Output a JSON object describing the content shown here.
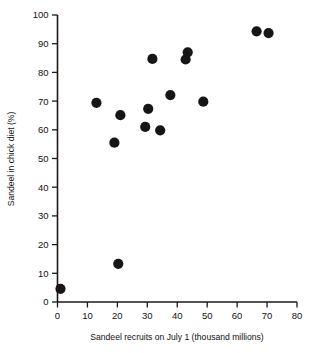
{
  "chart_data": {
    "type": "scatter",
    "title": "",
    "xlabel": "Sandeel recruits on July 1 (thousand millions)",
    "ylabel": "Sandeel in chick diet (%)",
    "xlim": [
      0,
      80
    ],
    "ylim": [
      0,
      100
    ],
    "xticks": [
      0,
      10,
      20,
      30,
      40,
      50,
      60,
      70,
      80
    ],
    "yticks": [
      0,
      10,
      20,
      30,
      40,
      50,
      60,
      70,
      80,
      90,
      100
    ],
    "xtick_labels": [
      "0",
      "10",
      "20",
      "30",
      "40",
      "50",
      "60",
      "70",
      "80"
    ],
    "ytick_labels": [
      "0",
      "10",
      "20",
      "30",
      "40",
      "50",
      "60",
      "70",
      "80",
      "90",
      "100"
    ],
    "grid": false,
    "legend": false,
    "legend_position": "none",
    "marker": "filled-circle",
    "marker_color": "#161616",
    "marker_size": 6.4,
    "n_points": 15,
    "x": [
      1.0,
      13.0,
      19.0,
      20.3,
      21.0,
      29.3,
      30.3,
      31.7,
      34.3,
      37.7,
      42.8,
      43.5,
      48.7,
      66.5,
      70.5
    ],
    "y": [
      4.6,
      69.4,
      55.5,
      13.3,
      65.1,
      61.0,
      67.3,
      84.7,
      59.8,
      72.1,
      84.5,
      87.0,
      69.8,
      94.3,
      93.7
    ],
    "points": [
      {
        "x": 1.0,
        "y": 4.6
      },
      {
        "x": 13.0,
        "y": 69.4
      },
      {
        "x": 19.0,
        "y": 55.5
      },
      {
        "x": 20.3,
        "y": 13.3
      },
      {
        "x": 21.0,
        "y": 65.1
      },
      {
        "x": 29.3,
        "y": 61.0
      },
      {
        "x": 30.3,
        "y": 67.3
      },
      {
        "x": 31.7,
        "y": 84.7
      },
      {
        "x": 34.3,
        "y": 59.8
      },
      {
        "x": 37.7,
        "y": 72.1
      },
      {
        "x": 42.8,
        "y": 84.5
      },
      {
        "x": 43.5,
        "y": 87.0
      },
      {
        "x": 48.7,
        "y": 69.8
      },
      {
        "x": 66.5,
        "y": 94.3
      },
      {
        "x": 70.5,
        "y": 93.7
      }
    ]
  },
  "axes": {
    "x_title": "Sandeel recruits on July 1 (thousand millions)",
    "y_title": "Sandeel in chick diet (%)"
  },
  "colors": {
    "marker": "#161616",
    "axis": "#1a1a1a",
    "text": "#111111",
    "background": "#ffffff"
  }
}
